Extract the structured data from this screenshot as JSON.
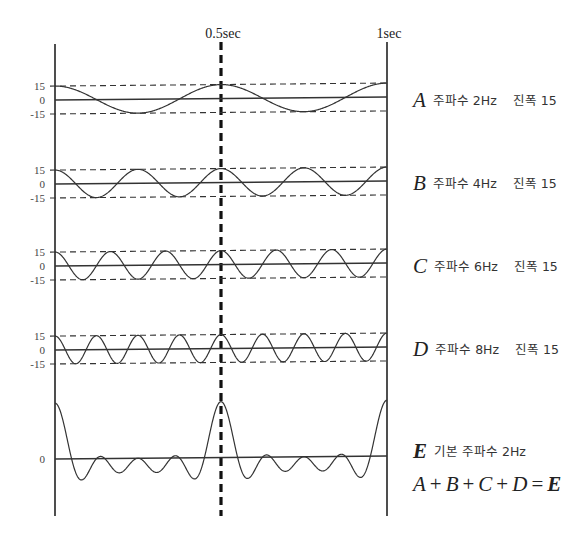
{
  "figure": {
    "time_labels": {
      "half": "0.5sec",
      "full": "1sec"
    },
    "axes": {
      "left_x": 55,
      "right_x": 387,
      "mid_x": 221,
      "top_y": 44,
      "bottom_y": 516,
      "tilt_px": -3
    },
    "rows": [
      {
        "id": "A",
        "letter": "A",
        "freq_label": "주파수 2Hz",
        "amp_label": "진폭 15",
        "freq_hz": 2,
        "amplitude": 15,
        "zero_y": 100,
        "scale": 0.93,
        "tick_labels": [
          "15",
          "0",
          "-15"
        ],
        "label_y": 90
      },
      {
        "id": "B",
        "letter": "B",
        "freq_label": "주파수 4Hz",
        "amp_label": "진폭 15",
        "freq_hz": 4,
        "amplitude": 15,
        "zero_y": 184,
        "scale": 0.93,
        "tick_labels": [
          "15",
          "0",
          "-15"
        ],
        "label_y": 173
      },
      {
        "id": "C",
        "letter": "C",
        "freq_label": "주파수 6Hz",
        "amp_label": "진폭 15",
        "freq_hz": 6,
        "amplitude": 15,
        "zero_y": 266,
        "scale": 0.93,
        "tick_labels": [
          "15",
          "0",
          "-15"
        ],
        "label_y": 256
      },
      {
        "id": "D",
        "letter": "D",
        "freq_label": "주파수 8Hz",
        "amp_label": "진폭 15",
        "freq_hz": 8,
        "amplitude": 15,
        "zero_y": 350,
        "scale": 0.93,
        "tick_labels": [
          "15",
          "0",
          "-15"
        ],
        "label_y": 339
      }
    ],
    "sum": {
      "letter": "E",
      "label": "기본 주파수 2Hz",
      "zero_y": 459,
      "scale": 0.93,
      "tick_label": "0",
      "components_hz": [
        2,
        4,
        6,
        8
      ],
      "amplitude": 15,
      "label_y": 441
    },
    "equation": {
      "terms": [
        "A",
        "B",
        "C",
        "D"
      ],
      "plus": "+",
      "equals": "=",
      "result": "E"
    },
    "colors": {
      "line": "#333333",
      "axis": "#222222",
      "dashed_mid": "#111111"
    }
  },
  "chart_data": {
    "type": "line",
    "title": "",
    "xlabel": "time (sec)",
    "ylabel": "",
    "x_ticks": [
      "0",
      "0.5sec",
      "1sec"
    ],
    "xlim": [
      0,
      1
    ],
    "series": [
      {
        "name": "A",
        "function": "15*cos(2π·2t)",
        "freq_hz": 2,
        "amplitude": 15,
        "ylim": [
          -15,
          15
        ],
        "y_ticks": [
          15,
          0,
          -15
        ]
      },
      {
        "name": "B",
        "function": "15*cos(2π·4t)",
        "freq_hz": 4,
        "amplitude": 15,
        "ylim": [
          -15,
          15
        ],
        "y_ticks": [
          15,
          0,
          -15
        ]
      },
      {
        "name": "C",
        "function": "15*cos(2π·6t)",
        "freq_hz": 6,
        "amplitude": 15,
        "ylim": [
          -15,
          15
        ],
        "y_ticks": [
          15,
          0,
          -15
        ]
      },
      {
        "name": "D",
        "function": "15*cos(2π·8t)",
        "freq_hz": 8,
        "amplitude": 15,
        "ylim": [
          -15,
          15
        ],
        "y_ticks": [
          15,
          0,
          -15
        ]
      },
      {
        "name": "E",
        "function": "A+B+C+D",
        "fundamental_hz": 2,
        "peak": 60,
        "y_ticks": [
          0
        ]
      }
    ],
    "annotations": [
      "A 주파수 2Hz 진폭 15",
      "B 주파수 4Hz 진폭 15",
      "C 주파수 6Hz 진폭 15",
      "D 주파수 8Hz 진폭 15",
      "E 기본 주파수 2Hz",
      "A + B + C + D = E"
    ]
  }
}
